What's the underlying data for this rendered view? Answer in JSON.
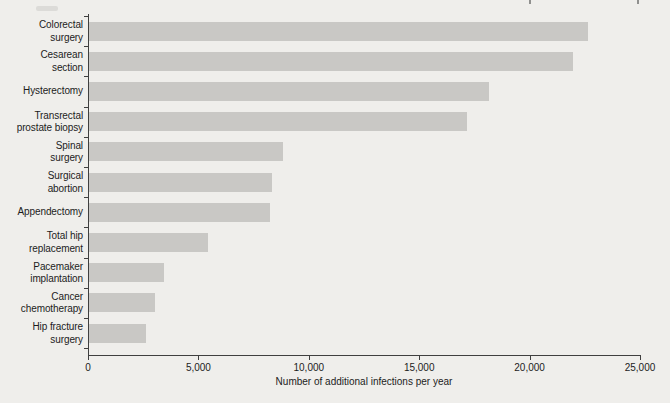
{
  "figure": {
    "colors": {
      "background": "#efeeeb",
      "bar": "#c9c8c5",
      "axis": "#3f3f3f",
      "text": "#1c1c1c",
      "artifact_light": "#dcdbd8",
      "artifact_dark": "#90908e"
    }
  },
  "chart_data": {
    "type": "bar",
    "orientation": "horizontal",
    "title": "",
    "xlabel": "Number of additional infections per year",
    "ylabel": "",
    "xlim": [
      0,
      25000
    ],
    "grid": false,
    "legend": false,
    "x_ticks": [
      0,
      5000,
      10000,
      15000,
      20000,
      25000
    ],
    "x_tick_labels": [
      "0",
      "5,000",
      "10,000",
      "15,000",
      "20,000",
      "25,000"
    ],
    "categories": [
      "Colorectal surgery",
      "Cesarean section",
      "Hysterectomy",
      "Transrectal prostate biopsy",
      "Spinal surgery",
      "Surgical abortion",
      "Appendectomy",
      "Total hip replacement",
      "Pacemaker implantation",
      "Cancer chemotherapy",
      "Hip fracture surgery"
    ],
    "category_display": [
      "Colorectal\nsurgery",
      "Cesarean\nsection",
      "Hysterectomy",
      "Transrectal\nprostate biopsy",
      "Spinal\nsurgery",
      "Surgical\nabortion",
      "Appendectomy",
      "Total hip\nreplacement",
      "Pacemaker\nimplantation",
      "Cancer\nchemotherapy",
      "Hip fracture\nsurgery"
    ],
    "values": [
      22600,
      21900,
      18100,
      17100,
      8800,
      8300,
      8200,
      5400,
      3400,
      3000,
      2600
    ]
  }
}
